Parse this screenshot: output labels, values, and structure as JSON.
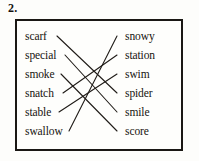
{
  "question": {
    "number": "2."
  },
  "exercise": {
    "type": "matching",
    "left_column": [
      {
        "id": "scarf",
        "label": "scarf"
      },
      {
        "id": "special",
        "label": "special"
      },
      {
        "id": "smoke",
        "label": "smoke"
      },
      {
        "id": "snatch",
        "label": "snatch"
      },
      {
        "id": "stable",
        "label": "stable"
      },
      {
        "id": "swallow",
        "label": "swallow"
      }
    ],
    "right_column": [
      {
        "id": "snowy",
        "label": "snowy"
      },
      {
        "id": "station",
        "label": "station"
      },
      {
        "id": "swim",
        "label": "swim"
      },
      {
        "id": "spider",
        "label": "spider"
      },
      {
        "id": "smile",
        "label": "smile"
      },
      {
        "id": "score",
        "label": "score"
      }
    ],
    "connections": [
      {
        "from": "scarf",
        "to": "spider"
      },
      {
        "from": "special",
        "to": "smile"
      },
      {
        "from": "smoke",
        "to": "score"
      },
      {
        "from": "snatch",
        "to": "station"
      },
      {
        "from": "stable",
        "to": "swim"
      },
      {
        "from": "swallow",
        "to": "snowy"
      }
    ],
    "colors": {
      "ink": "#17140f",
      "border": "#1a1714",
      "paper": "#fefefc",
      "line": "#201c18"
    }
  }
}
